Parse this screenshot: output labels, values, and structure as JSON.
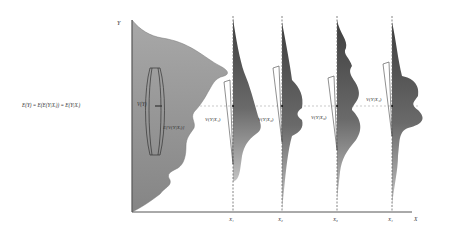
{
  "diagram": {
    "axes": {
      "y_label": "Y",
      "x_label": "X"
    },
    "marginal": {
      "mean_label": "E(Y) = E(E(Y|Xᵢ)) = E(Y|Xᵢ)",
      "variance_label": "V(Y)",
      "expected_conditional_variance_label": "E[V(Y|Xᵢ)]"
    },
    "conditionals": [
      {
        "x_label": "X₁",
        "variance_label": "V(Y|X₁)"
      },
      {
        "x_label": "X₂",
        "variance_label": "V(Y|X₂)"
      },
      {
        "x_label": "X₃",
        "variance_label": "V(Y|X₃)"
      },
      {
        "x_label": "X₄",
        "variance_label": "V(Y|X₄)"
      }
    ],
    "colors": {
      "marginal_fill_top": "#9a9a9a",
      "marginal_fill_bottom": "#8a8a8a",
      "conditional_fill_top": "#4a4a4a",
      "conditional_fill_bottom": "#b5b5b5",
      "axis": "#555555",
      "mean_line": "#bbbbbb"
    }
  }
}
